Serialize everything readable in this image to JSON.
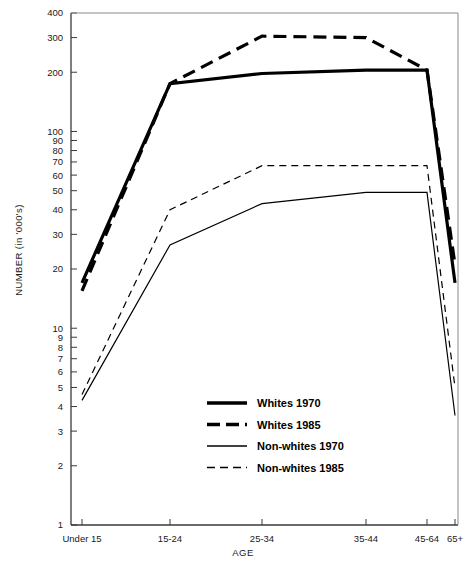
{
  "chart_data": {
    "type": "line",
    "title": "",
    "xlabel": "AGE",
    "ylabel": "NUMBER (in '000's)",
    "yscale": "log",
    "ylim": [
      1,
      400
    ],
    "grid": false,
    "legend_position": "center",
    "categories": [
      "Under 15",
      "15-24",
      "25-34",
      "35-44",
      "45-64",
      "65+"
    ],
    "ytick_labels": [
      "400",
      "300",
      "200",
      "100",
      "90",
      "80",
      "70",
      "60",
      "50",
      "40",
      "30",
      "20",
      "10",
      "9",
      "8",
      "7",
      "6",
      "5",
      "4",
      "3",
      "2",
      "1"
    ],
    "ytick_values": [
      400,
      300,
      200,
      100,
      90,
      80,
      70,
      60,
      50,
      40,
      30,
      20,
      10,
      9,
      8,
      7,
      6,
      5,
      4,
      3,
      2,
      1
    ],
    "series": [
      {
        "name": "Whites 1970",
        "style": "solid",
        "width": "thick",
        "color": "#000000",
        "values": [
          17,
          175,
          197,
          205,
          205,
          17
        ]
      },
      {
        "name": "Whites 1985",
        "style": "dashed",
        "width": "thick",
        "color": "#000000",
        "values": [
          15.5,
          175,
          305,
          300,
          205,
          21
        ]
      },
      {
        "name": "Non-whites 1970",
        "style": "solid",
        "width": "thin",
        "color": "#000000",
        "values": [
          4.3,
          26.5,
          43,
          49,
          49,
          3.6
        ]
      },
      {
        "name": "Non-whites 1985",
        "style": "dashed",
        "width": "thin",
        "color": "#000000",
        "values": [
          4.6,
          40,
          67,
          67,
          67,
          5.0
        ]
      }
    ]
  },
  "legend": {
    "items": [
      {
        "label": "Whites 1970"
      },
      {
        "label": "Whites 1985"
      },
      {
        "label": "Non-whites 1970"
      },
      {
        "label": "Non-whites 1985"
      }
    ]
  },
  "axes": {
    "x_title": "AGE",
    "y_title": "NUMBER (in '000's)"
  },
  "colors": {
    "ink": "#000000",
    "axis": "#444444",
    "background": "#ffffff"
  }
}
